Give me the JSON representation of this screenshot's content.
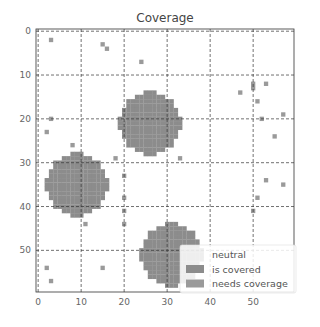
{
  "chart_data": {
    "type": "heatmap",
    "title": "Coverage",
    "xlabel": "",
    "ylabel": "",
    "grid_size": [
      60,
      60
    ],
    "xlim": [
      0,
      59
    ],
    "ylim": [
      59,
      0
    ],
    "xticks": [
      0,
      10,
      20,
      30,
      40,
      50
    ],
    "yticks": [
      0,
      10,
      20,
      30,
      40,
      50
    ],
    "grid": true,
    "grid_style": "dashed",
    "legend_position": "lower right",
    "categories": [
      "neutral",
      "is covered",
      "needs coverage"
    ],
    "colors": {
      "neutral": "#ffffff",
      "is covered": "#8c8c8c",
      "needs coverage": "#9a9a9a"
    },
    "covered_regions": [
      {
        "center": [
          26,
          21
        ],
        "radius": 7
      },
      {
        "center": [
          9,
          35
        ],
        "radius": 7
      },
      {
        "center": [
          31,
          51
        ],
        "radius": 7
      }
    ],
    "needs_coverage_points": [
      [
        3,
        2
      ],
      [
        15,
        3
      ],
      [
        16,
        4
      ],
      [
        24,
        7
      ],
      [
        47,
        14
      ],
      [
        50,
        13
      ],
      [
        50,
        12
      ],
      [
        53,
        12
      ],
      [
        51,
        16
      ],
      [
        57,
        19
      ],
      [
        3,
        20
      ],
      [
        20,
        20
      ],
      [
        2,
        23
      ],
      [
        52,
        20
      ],
      [
        55,
        24
      ],
      [
        8,
        26
      ],
      [
        18,
        29
      ],
      [
        33,
        29
      ],
      [
        20,
        33
      ],
      [
        53,
        34
      ],
      [
        57,
        35
      ],
      [
        20,
        38
      ],
      [
        51,
        38
      ],
      [
        20,
        41
      ],
      [
        50,
        41
      ],
      [
        11,
        44
      ],
      [
        20,
        44
      ],
      [
        2,
        54
      ],
      [
        15,
        54
      ],
      [
        3,
        57
      ]
    ]
  },
  "legend": {
    "items": [
      {
        "label": "neutral",
        "color": "#ffffff"
      },
      {
        "label": "is covered",
        "color": "#8c8c8c"
      },
      {
        "label": "needs coverage",
        "color": "#9a9a9a"
      }
    ]
  }
}
